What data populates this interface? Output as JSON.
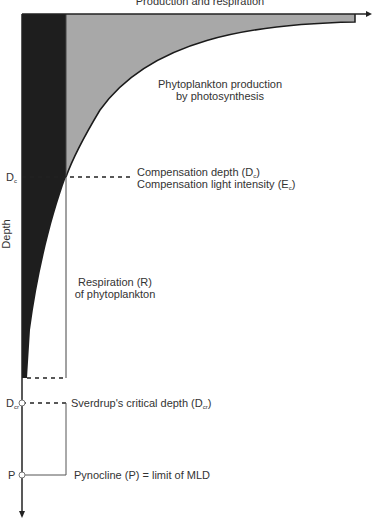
{
  "diagram": {
    "x_axis_title": "Production and respiration",
    "y_axis_title": "Depth",
    "regions": {
      "production": "Phytoplankton production by photosynthesis",
      "production_line1": "Phytoplankton production",
      "production_line2": "by photosynthesis",
      "respiration_line1": "Respiration (R)",
      "respiration_line2": "of phytoplankton"
    },
    "depth_marks": [
      {
        "symbol": "D",
        "subscript": "c",
        "label": "Compensation depth (D",
        "label_sub": "c",
        "label_end": ")"
      },
      {
        "symbol": "D",
        "subscript": "cr",
        "label": "Sverdrup's critical depth (D",
        "label_sub": "cr",
        "label_end": ")"
      },
      {
        "symbol": "P",
        "subscript": "",
        "label": "Pynocline (P) = limit of MLD"
      }
    ],
    "compensation_light": {
      "label": "Compensation light intensity (E",
      "label_sub": "c",
      "label_end": ")"
    },
    "colors": {
      "respiration_fill": "#1e1e1e",
      "production_fill": "#a8a8a8",
      "axis": "#222222",
      "text": "#333333"
    }
  }
}
